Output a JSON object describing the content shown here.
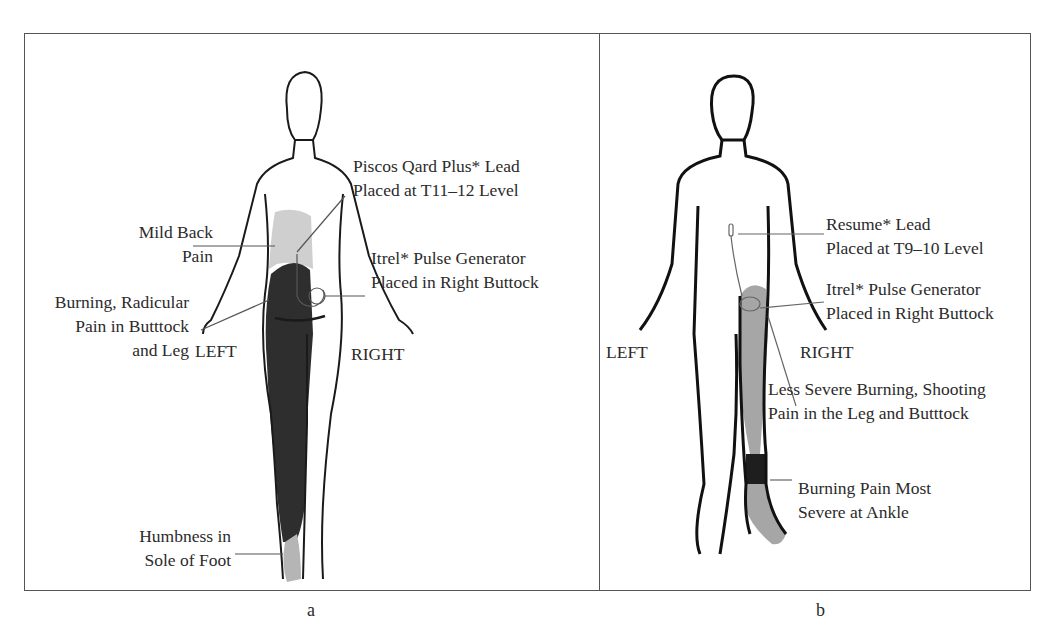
{
  "figure": {
    "panels": [
      {
        "id": "a",
        "caption": "a",
        "side_left": "LEFT",
        "side_right": "RIGHT",
        "annotations": {
          "lead_line1": "Piscos Qard Plus* Lead",
          "lead_line2": "Placed at T11–12 Level",
          "back_line1": "Mild Back",
          "back_line2": "Pain",
          "gen_line1": "Itrel* Pulse Generator",
          "gen_line2": "Placed in Right Buttock",
          "burn_line1": "Burning, Radicular",
          "burn_line2": "Pain in Butttock",
          "burn_line3": "and Leg",
          "numb_line1": "Humbness in",
          "numb_line2": "Sole of Foot"
        }
      },
      {
        "id": "b",
        "caption": "b",
        "side_left": "LEFT",
        "side_right": "RIGHT",
        "annotations": {
          "lead_line1": "Resume* Lead",
          "lead_line2": "Placed at T9–10 Level",
          "gen_line1": "Itrel* Pulse Generator",
          "gen_line2": "Placed in Right Buttock",
          "less_line1": "Less Severe Burning, Shooting",
          "less_line2": "Pain in the Leg and Butttock",
          "ankle_line1": "Burning Pain Most",
          "ankle_line2": "Severe at Ankle"
        }
      }
    ],
    "colors": {
      "severe_pain": "#2e2e2e",
      "moderate_pain": "#a6a6a6",
      "mild_pain": "#cfcfcf",
      "outline": "#1a1a1a",
      "border": "#555555"
    }
  }
}
